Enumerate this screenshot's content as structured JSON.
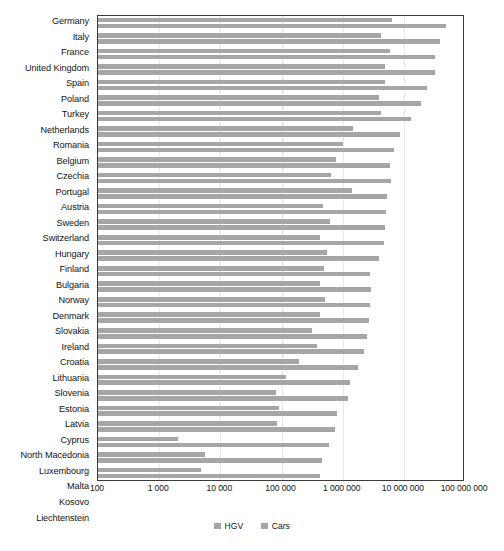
{
  "chart_data": {
    "type": "bar",
    "orientation": "horizontal",
    "title": "",
    "subtitle": "",
    "xlabel": "",
    "ylabel": "",
    "xscale": "log",
    "xlim": [
      100,
      100000000
    ],
    "grid": true,
    "legend_position": "bottom",
    "xticks": [
      {
        "value": 100,
        "label": "100"
      },
      {
        "value": 1000,
        "label": "1 000"
      },
      {
        "value": 10000,
        "label": "10 000"
      },
      {
        "value": 100000,
        "label": "100 000"
      },
      {
        "value": 1000000,
        "label": "1 000 000"
      },
      {
        "value": 10000000,
        "label": "10 000 000"
      },
      {
        "value": 100000000,
        "label": "100 000 000"
      }
    ],
    "categories": [
      "Germany",
      "Italy",
      "France",
      "United Kingdom",
      "Spain",
      "Poland",
      "Turkey",
      "Netherlands",
      "Romania",
      "Belgium",
      "Czechia",
      "Portugal",
      "Austria",
      "Sweden",
      "Switzerland",
      "Hungary",
      "Finland",
      "Bulgaria",
      "Norway",
      "Denmark",
      "Slovakia",
      "Ireland",
      "Croatia",
      "Lithuania",
      "Slovenia",
      "Estonia",
      "Latvia",
      "Cyprus",
      "North Macedonia",
      "Luxembourg",
      "Malta",
      "Kosovo",
      "Liechtenstein"
    ],
    "series": [
      {
        "name": "HGV",
        "color": "#a6a6a6",
        "values": [
          6400000,
          4200000,
          6000000,
          4900000,
          5000000,
          3900000,
          4300000,
          1500000,
          1000000,
          780000,
          640000,
          1400000,
          470000,
          620000,
          420000,
          560000,
          490000,
          430000,
          510000,
          430000,
          310000,
          380000,
          190000,
          120000,
          82000,
          92000,
          86000,
          2000,
          5700,
          4900,
          1000,
          2000,
          300
        ]
      },
      {
        "name": "Cars",
        "color": "#a6a6a6",
        "values": [
          48000000,
          39000000,
          32000000,
          32000000,
          24000000,
          19000000,
          13000000,
          8800000,
          6900000,
          5900000,
          6200000,
          5300000,
          5100000,
          4900000,
          4700000,
          3900000,
          2800000,
          2900000,
          2800000,
          2700000,
          2500000,
          2200000,
          1800000,
          1300000,
          1200000,
          820000,
          760000,
          600000,
          460000,
          430000,
          420000,
          280000,
          32000
        ]
      }
    ]
  },
  "legend": {
    "items": [
      {
        "label": "HGV"
      },
      {
        "label": "Cars"
      }
    ]
  }
}
